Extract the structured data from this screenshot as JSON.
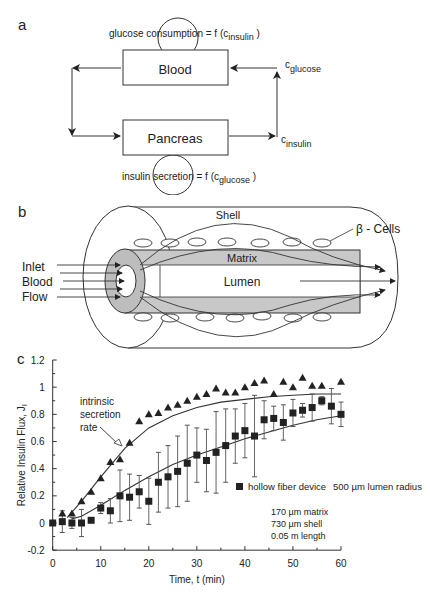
{
  "panel_a": {
    "label": "a",
    "box_top": "Blood",
    "box_bottom": "Pancreas",
    "loop_top_text": "glucose consumption = f (c",
    "loop_top_sub": "insulin",
    "loop_top_close": " )",
    "loop_bottom_text": "insulin secretion = f (c",
    "loop_bottom_sub": "glucose",
    "loop_bottom_close": " )",
    "right_top_c": "c",
    "right_top_sub": "glucose",
    "right_bottom_c": "c",
    "right_bottom_sub": "insulin"
  },
  "panel_b": {
    "label": "b",
    "shell": "Shell",
    "beta_cells": "β - Cells",
    "matrix": "Matrix",
    "lumen": "Lumen",
    "inlet": "Inlet",
    "blood": "Blood",
    "flow": "Flow"
  },
  "panel_c": {
    "label": "c",
    "annotation": [
      "intrinsic",
      "secretion",
      "rate"
    ],
    "legend_label": "hollow fiber device",
    "legend_param": "500 µm lumen radius",
    "params": [
      "170 µm matrix",
      "730 µm shell",
      "0.05 m length"
    ]
  },
  "chart_data": {
    "type": "scatter",
    "title": "",
    "xlabel": "Time, t (min)",
    "ylabel": "Relative Insulin Flux, J_I",
    "xlim": [
      0,
      60
    ],
    "ylim": [
      -0.2,
      1.2
    ],
    "xticks": [
      0,
      10,
      20,
      30,
      40,
      50,
      60
    ],
    "yticks": [
      -0.2,
      0,
      0.2,
      0.4,
      0.6,
      0.8,
      1,
      1.2
    ],
    "grid": false,
    "legend_position": "inside right middle",
    "series": [
      {
        "name": "intrinsic secretion rate (triangles)",
        "marker": "triangle",
        "x": [
          2,
          4,
          6,
          8,
          10,
          12,
          14,
          16,
          18,
          20,
          22,
          24,
          26,
          28,
          30,
          32,
          34,
          36,
          38,
          40,
          42,
          44,
          46,
          48,
          50,
          52,
          54,
          56,
          60
        ],
        "y": [
          0.07,
          0.07,
          0.16,
          0.23,
          0.33,
          0.45,
          0.47,
          0.59,
          0.75,
          0.8,
          0.81,
          0.85,
          0.87,
          0.9,
          0.93,
          0.95,
          0.99,
          0.96,
          0.96,
          1.0,
          1.03,
          1.05,
          0.95,
          1.04,
          1.0,
          1.07,
          1.01,
          1.01,
          1.04
        ]
      },
      {
        "name": "hollow fiber device",
        "marker": "square",
        "x": [
          0,
          2,
          4,
          6,
          8,
          10,
          12,
          14,
          16,
          18,
          20,
          22,
          24,
          26,
          28,
          30,
          32,
          34,
          36,
          38,
          40,
          42,
          44,
          46,
          48,
          50,
          52,
          54,
          56,
          58,
          60
        ],
        "y": [
          0.0,
          0.01,
          0.0,
          0.0,
          0.02,
          0.11,
          0.09,
          0.2,
          0.19,
          0.23,
          0.16,
          0.3,
          0.34,
          0.38,
          0.44,
          0.5,
          0.46,
          0.52,
          0.57,
          0.64,
          0.68,
          0.64,
          0.76,
          0.77,
          0.74,
          0.81,
          0.83,
          0.85,
          0.9,
          0.86,
          0.8
        ],
        "error": [
          0,
          0.08,
          0.04,
          0.1,
          0,
          0.04,
          0.09,
          0.19,
          0.17,
          0.12,
          0.17,
          0.22,
          0.23,
          0.26,
          0.28,
          0.2,
          0.23,
          0.3,
          0.27,
          0.2,
          0.2,
          0.3,
          0.14,
          0.09,
          0.13,
          0.1,
          0.05,
          0.1,
          0.03,
          0.13,
          0.09
        ]
      },
      {
        "name": "model curve (intrinsic)",
        "type": "line",
        "x": [
          3,
          6,
          10,
          15,
          20,
          25,
          30,
          35,
          40,
          45,
          50,
          55,
          60
        ],
        "y": [
          0.04,
          0.16,
          0.34,
          0.55,
          0.7,
          0.79,
          0.85,
          0.89,
          0.91,
          0.93,
          0.94,
          0.95,
          0.95
        ]
      },
      {
        "name": "model curve (hollow fiber)",
        "type": "line",
        "x": [
          4,
          6,
          10,
          15,
          20,
          25,
          30,
          35,
          40,
          45,
          50,
          55,
          60
        ],
        "y": [
          0.03,
          0.05,
          0.13,
          0.24,
          0.34,
          0.43,
          0.5,
          0.56,
          0.62,
          0.67,
          0.72,
          0.76,
          0.79
        ]
      }
    ],
    "annotations": [
      "intrinsic secretion rate",
      "500 µm lumen radius",
      "170 µm matrix",
      "730 µm shell",
      "0.05 m length"
    ]
  }
}
